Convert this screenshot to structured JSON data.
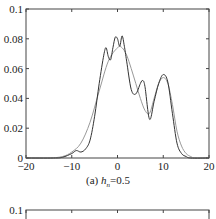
{
  "chart_data": [
    {
      "type": "line",
      "title": "",
      "caption": {
        "prefix": "(a) ",
        "var": "h",
        "sub": "n",
        "suffix": "=0.5"
      },
      "xlabel": "",
      "ylabel": "",
      "xlim": [
        -20,
        20
      ],
      "ylim": [
        0,
        0.1
      ],
      "xticks": [
        "−20",
        "−10",
        "0",
        "10",
        "20"
      ],
      "yticks": [
        "0",
        "0.02",
        "0.04",
        "0.06",
        "0.08",
        "0.1"
      ],
      "grid": false,
      "series": [
        {
          "name": "estimate (h_n=0.5)",
          "color": "#333333",
          "x": [
            -20,
            -14,
            -12,
            -10,
            -9,
            -8,
            -7,
            -6,
            -5,
            -4,
            -3,
            -2.5,
            -2,
            -1.5,
            -1,
            -0.5,
            0,
            0.5,
            1,
            1.5,
            2,
            3,
            4,
            5,
            5.5,
            6,
            7,
            8,
            9,
            10,
            11,
            12,
            13,
            14,
            15,
            16,
            20
          ],
          "y": [
            0,
            0,
            0.0005,
            0.003,
            0.005,
            0.004,
            0.006,
            0.012,
            0.028,
            0.05,
            0.069,
            0.074,
            0.068,
            0.066,
            0.074,
            0.081,
            0.08,
            0.075,
            0.082,
            0.075,
            0.065,
            0.046,
            0.043,
            0.05,
            0.052,
            0.048,
            0.026,
            0.038,
            0.05,
            0.056,
            0.051,
            0.03,
            0.01,
            0.003,
            0.001,
            0,
            0
          ]
        },
        {
          "name": "true density",
          "color": "#999999",
          "x": [
            -20,
            -15,
            -12,
            -10,
            -8,
            -6,
            -4,
            -2,
            0,
            1,
            2,
            3,
            4,
            5,
            6,
            7,
            8,
            9,
            10,
            11,
            12,
            13,
            14,
            15,
            16,
            17,
            20
          ],
          "y": [
            0,
            0,
            0.001,
            0.004,
            0.01,
            0.024,
            0.045,
            0.065,
            0.074,
            0.074,
            0.069,
            0.06,
            0.05,
            0.04,
            0.032,
            0.03,
            0.04,
            0.05,
            0.054,
            0.05,
            0.036,
            0.018,
            0.008,
            0.003,
            0.001,
            0,
            0
          ]
        }
      ]
    },
    {
      "type": "line",
      "partial": true,
      "ylim": [
        0,
        0.1
      ],
      "yticks": [
        "0.1"
      ]
    }
  ]
}
